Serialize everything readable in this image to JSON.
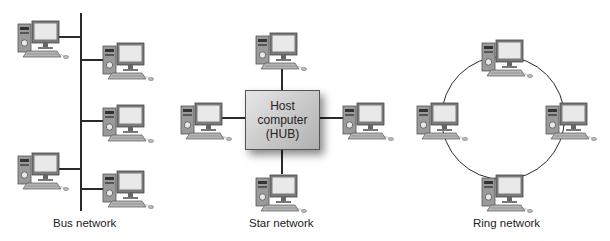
{
  "diagrams": {
    "bus": {
      "caption": "Bus network",
      "nodes": 5
    },
    "star": {
      "caption": "Star network",
      "hub": {
        "line1": "Host",
        "line2": "computer",
        "line3": "(HUB)"
      },
      "nodes": 4
    },
    "ring": {
      "caption": "Ring network",
      "nodes": 4
    }
  },
  "colors": {
    "line": "#2a2a2a",
    "hub_fill": "#c8c8c8",
    "background": "#ffffff"
  }
}
